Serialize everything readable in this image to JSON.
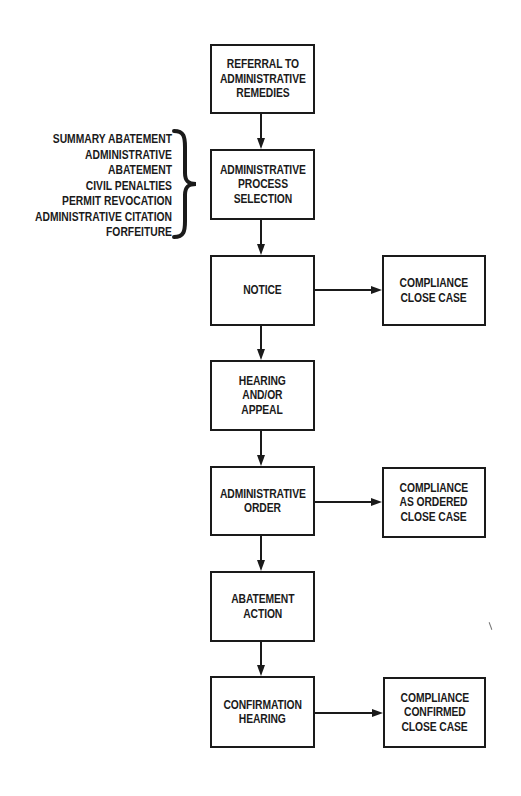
{
  "diagram": {
    "type": "flowchart",
    "main_flow": [
      {
        "id": "referral",
        "lines": [
          "REFERRAL TO",
          "ADMINISTRATIVE",
          "REMEDIES"
        ]
      },
      {
        "id": "process-selection",
        "lines": [
          "ADMINISTRATIVE",
          "PROCESS",
          "SELECTION"
        ]
      },
      {
        "id": "notice",
        "lines": [
          "NOTICE"
        ]
      },
      {
        "id": "hearing",
        "lines": [
          "HEARING",
          "AND/OR",
          "APPEAL"
        ]
      },
      {
        "id": "admin-order",
        "lines": [
          "ADMINISTRATIVE",
          "ORDER"
        ]
      },
      {
        "id": "abatement",
        "lines": [
          "ABATEMENT",
          "ACTION"
        ]
      },
      {
        "id": "confirmation",
        "lines": [
          "CONFIRMATION",
          "HEARING"
        ]
      }
    ],
    "side_outcomes": [
      {
        "id": "compliance-close",
        "from": "notice",
        "lines": [
          "COMPLIANCE",
          "CLOSE CASE"
        ]
      },
      {
        "id": "compliance-ordered",
        "from": "admin-order",
        "lines": [
          "COMPLIANCE",
          "AS ORDERED",
          "CLOSE CASE"
        ]
      },
      {
        "id": "compliance-confirmed",
        "from": "confirmation",
        "lines": [
          "COMPLIANCE",
          "CONFIRMED",
          "CLOSE CASE"
        ]
      }
    ],
    "process_options": {
      "attached_to": "process-selection",
      "items": [
        "SUMMARY ABATEMENT",
        "ADMINISTRATIVE",
        "ABATEMENT",
        "CIVIL PENALTIES",
        "PERMIT REVOCATION",
        "ADMINISTRATIVE CITATION",
        "FORFEITURE"
      ]
    },
    "colors": {
      "stroke": "#1a1a1a",
      "background": "#ffffff",
      "text": "#1a1a1a"
    }
  }
}
